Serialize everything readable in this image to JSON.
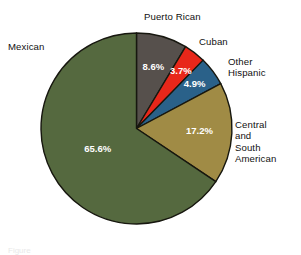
{
  "figure": {
    "background": "#ffffff",
    "caption_partial": "Figure"
  },
  "chart_data": {
    "type": "pie",
    "title": "",
    "xlabel": "",
    "ylabel": "",
    "legend_position": "none",
    "grid": false,
    "start_angle_deg": 0,
    "direction": "clockwise",
    "units": "percent",
    "total": 100,
    "categories": [
      "Puerto Rican",
      "Cuban",
      "Other Hispanic",
      "Central and South American",
      "Mexican"
    ],
    "values": [
      8.6,
      3.7,
      4.9,
      17.2,
      65.6
    ],
    "value_labels": [
      "8.6%",
      "3.7%",
      "4.9%",
      "17.2%",
      "65.6%"
    ],
    "colors": [
      "#56504c",
      "#e8271a",
      "#2a6189",
      "#a08b45",
      "#55693f"
    ],
    "slices": [
      {
        "name": "Puerto Rican",
        "value": 8.6,
        "value_label": "8.6%",
        "color": "#56504c",
        "label_lines": [
          "Puerto Rican"
        ]
      },
      {
        "name": "Cuban",
        "value": 3.7,
        "value_label": "3.7%",
        "color": "#e8271a",
        "label_lines": [
          "Cuban"
        ]
      },
      {
        "name": "Other Hispanic",
        "value": 4.9,
        "value_label": "4.9%",
        "color": "#2a6189",
        "label_lines": [
          "Other",
          "Hispanic"
        ]
      },
      {
        "name": "Central and South American",
        "value": 17.2,
        "value_label": "17.2%",
        "color": "#a08b45",
        "label_lines": [
          "Central",
          "and",
          "South",
          "American"
        ]
      },
      {
        "name": "Mexican",
        "value": 65.6,
        "value_label": "65.6%",
        "color": "#55693f",
        "label_lines": [
          "Mexican"
        ]
      }
    ]
  },
  "labels": {
    "mexican": "Mexican",
    "puerto_rican": "Puerto Rican",
    "cuban": "Cuban",
    "other_hispanic": "Other\nHispanic",
    "central_south": "Central\nand\nSouth\nAmerican"
  },
  "values": {
    "mexican": "65.6%",
    "puerto_rican": "8.6%",
    "cuban": "3.7%",
    "other_hispanic": "4.9%",
    "central_south": "17.2%"
  }
}
